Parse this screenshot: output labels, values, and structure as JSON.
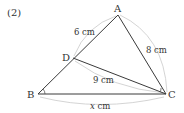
{
  "problem_number": "(2)",
  "vertices": {
    "A": {
      "label": "A",
      "x": 118,
      "y": 15
    },
    "B": {
      "label": "B",
      "x": 38,
      "y": 94
    },
    "C": {
      "label": "C",
      "x": 166,
      "y": 94
    },
    "D": {
      "label": "D",
      "x": 73,
      "y": 58
    }
  },
  "measurements": {
    "AD": "6 cm",
    "AC": "8 cm",
    "DC": "9 cm",
    "BC_var": "x",
    "BC_unit": " cm"
  },
  "colors": {
    "line": "#3a3a3a",
    "arc": "#c8c8c8",
    "text": "#333333"
  }
}
